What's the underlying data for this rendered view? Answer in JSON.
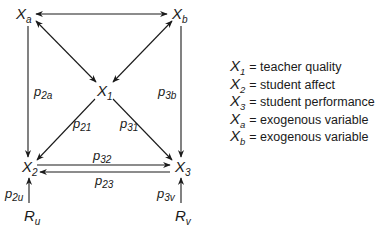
{
  "nodes": {
    "Xa": {
      "base": "X",
      "sub": "a"
    },
    "Xb": {
      "base": "X",
      "sub": "b"
    },
    "X1": {
      "base": "X",
      "sub": "1"
    },
    "X2": {
      "base": "X",
      "sub": "2"
    },
    "X3": {
      "base": "X",
      "sub": "3"
    },
    "Ru": {
      "base": "R",
      "sub": "u"
    },
    "Rv": {
      "base": "R",
      "sub": "v"
    }
  },
  "paths": {
    "p2a": {
      "base": "p",
      "sub": "2a"
    },
    "p3b": {
      "base": "p",
      "sub": "3b"
    },
    "p21": {
      "base": "p",
      "sub": "21"
    },
    "p31": {
      "base": "p",
      "sub": "31"
    },
    "p32": {
      "base": "p",
      "sub": "32"
    },
    "p23": {
      "base": "p",
      "sub": "23"
    },
    "p2u": {
      "base": "p",
      "sub": "2u"
    },
    "p3v": {
      "base": "p",
      "sub": "3v"
    }
  },
  "edges": [
    {
      "from": "Xa",
      "to": "Xb",
      "type": "bidirectional"
    },
    {
      "from": "Xa",
      "to": "X1",
      "type": "bidirectional"
    },
    {
      "from": "Xb",
      "to": "X1",
      "type": "bidirectional"
    },
    {
      "from": "Xa",
      "to": "X2",
      "type": "directed",
      "label": "p2a"
    },
    {
      "from": "Xb",
      "to": "X3",
      "type": "directed",
      "label": "p3b"
    },
    {
      "from": "X1",
      "to": "X2",
      "type": "directed",
      "label": "p21"
    },
    {
      "from": "X1",
      "to": "X3",
      "type": "directed",
      "label": "p31"
    },
    {
      "from": "X2",
      "to": "X3",
      "type": "directed",
      "label": "p32"
    },
    {
      "from": "X3",
      "to": "X2",
      "type": "directed",
      "label": "p23"
    },
    {
      "from": "Ru",
      "to": "X2",
      "type": "directed",
      "label": "p2u"
    },
    {
      "from": "Rv",
      "to": "X3",
      "type": "directed",
      "label": "p3v"
    }
  ],
  "legend": [
    {
      "base": "X",
      "sub": "1",
      "text": "= teacher quality"
    },
    {
      "base": "X",
      "sub": "2",
      "text": "= student affect"
    },
    {
      "base": "X",
      "sub": "3",
      "text": "= student performance"
    },
    {
      "base": "X",
      "sub": "a",
      "text": "= exogenous variable"
    },
    {
      "base": "X",
      "sub": "b",
      "text": "= exogenous variable"
    }
  ]
}
